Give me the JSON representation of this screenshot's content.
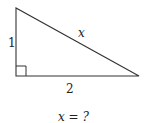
{
  "diagram": {
    "type": "right-triangle",
    "vertices": {
      "top": [
        16,
        8
      ],
      "right_angle": [
        16,
        76
      ],
      "right": [
        139,
        76
      ]
    },
    "sides": {
      "vertical": {
        "label": "1"
      },
      "horizontal": {
        "label": "2"
      },
      "hypotenuse": {
        "label": "x"
      }
    },
    "right_angle_marker": true,
    "question": "x = ?",
    "line_color": "#333333"
  }
}
